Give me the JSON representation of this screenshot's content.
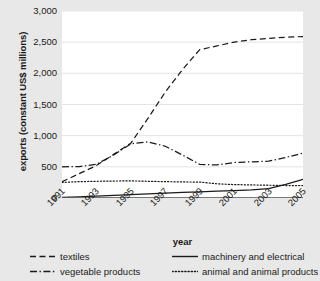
{
  "chart_data": {
    "type": "line",
    "title": "",
    "xlabel": "year",
    "ylabel": "exports (constant US$ millions)",
    "xlim": [
      1991,
      2005
    ],
    "ylim": [
      0,
      3000
    ],
    "grid": true,
    "legend_position": "bottom",
    "x": [
      1991,
      1992,
      1993,
      1994,
      1995,
      1996,
      1997,
      1998,
      1999,
      2000,
      2001,
      2002,
      2003,
      2004,
      2005
    ],
    "xticks": [
      "1991",
      "1993",
      "1995",
      "1997",
      "1999",
      "2001",
      "2003",
      "2005"
    ],
    "yticks": [
      "0",
      "500",
      "1,000",
      "1,500",
      "2,000",
      "2,500",
      "3,000"
    ],
    "series": [
      {
        "name": "textiles",
        "style": "dashed",
        "values": [
          260,
          390,
          520,
          700,
          880,
          1280,
          1700,
          2060,
          2380,
          2440,
          2500,
          2540,
          2560,
          2580,
          2590
        ]
      },
      {
        "name": "vegetable products",
        "style": "dash-dot",
        "values": [
          500,
          505,
          540,
          690,
          870,
          900,
          830,
          690,
          540,
          530,
          570,
          580,
          590,
          650,
          720
        ]
      },
      {
        "name": "machinery and electrical",
        "style": "solid",
        "values": [
          10,
          20,
          30,
          42,
          55,
          68,
          80,
          92,
          100,
          110,
          120,
          130,
          150,
          220,
          300
        ]
      },
      {
        "name": "animal and animal products",
        "style": "dotted",
        "values": [
          250,
          262,
          268,
          272,
          275,
          268,
          262,
          258,
          255,
          228,
          215,
          210,
          205,
          200,
          200
        ]
      }
    ]
  },
  "legend": {
    "items": [
      {
        "label": "textiles",
        "style": "dashed"
      },
      {
        "label": "machinery and electrical",
        "style": "solid"
      },
      {
        "label": "vegetable products",
        "style": "dash-dot"
      },
      {
        "label": "animal and animal products",
        "style": "dotted"
      }
    ]
  }
}
